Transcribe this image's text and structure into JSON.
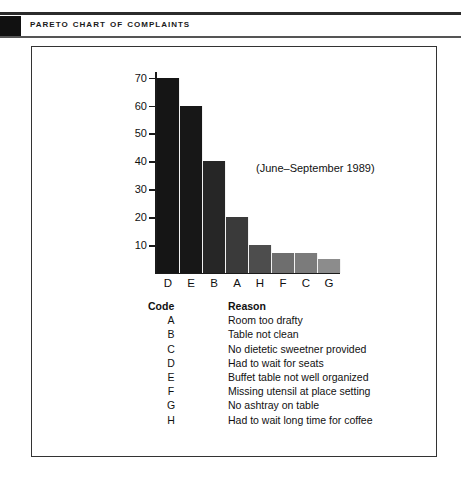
{
  "header": {
    "title": "Pareto Chart of Complaints"
  },
  "chart_data": {
    "type": "bar",
    "title": "Pareto Chart of Complaints",
    "annotation": "(June–September 1989)",
    "xlabel": "",
    "ylabel": "",
    "ylim": [
      0,
      72
    ],
    "grid": false,
    "legend_position": "below-chart",
    "categories": [
      "D",
      "E",
      "B",
      "A",
      "H",
      "F",
      "C",
      "G"
    ],
    "values": [
      70,
      60,
      40,
      20,
      10,
      7,
      7,
      5
    ],
    "bar_colors": [
      "#151515",
      "#171717",
      "#262626",
      "#3a3a3a",
      "#4d4d4d",
      "#6e6e6e",
      "#7b7b7b",
      "#8c8c8c"
    ],
    "y_ticks": [
      10,
      20,
      30,
      40,
      50,
      60,
      70
    ],
    "y_tick_labels": [
      "10",
      "20",
      "30",
      "40",
      "50",
      "60",
      "70"
    ]
  },
  "legend": {
    "headers": {
      "code": "Code",
      "reason": "Reason"
    },
    "rows": [
      {
        "code": "A",
        "reason": "Room too drafty"
      },
      {
        "code": "B",
        "reason": "Table not clean"
      },
      {
        "code": "C",
        "reason": "No dietetic sweetner provided"
      },
      {
        "code": "D",
        "reason": "Had to wait for seats"
      },
      {
        "code": "E",
        "reason": "Buffet table not well organized"
      },
      {
        "code": "F",
        "reason": "Missing utensil at place setting"
      },
      {
        "code": "G",
        "reason": "No ashtray on table"
      },
      {
        "code": "H",
        "reason": "Had to wait long time for coffee"
      }
    ]
  },
  "colors": {
    "ink": "#111111",
    "frame": "#333333",
    "rule": "#2b2b2b"
  }
}
